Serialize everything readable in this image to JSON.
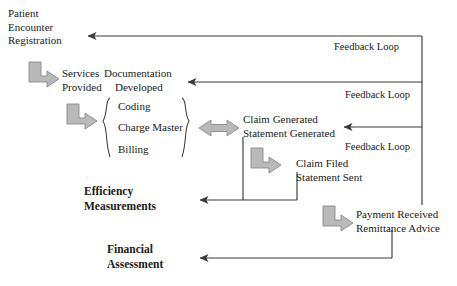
{
  "diagram": {
    "type": "flowchart",
    "colors": {
      "line": "#3a3a3a",
      "block_arrow_fill": "#b9b9b9",
      "block_arrow_stroke": "#8a8a8a",
      "text": "#1a1a1a",
      "background": "#ffffff"
    },
    "nodes": {
      "patient_encounter": "Patient\nEncounter\nRegistration",
      "services_provided": "Services\nProvided",
      "documentation_developed": "Documentation\n    Developed",
      "coding": "Coding",
      "charge_master": "Charge Master",
      "billing": "Billing",
      "claim_generated": "Claim Generated\nStatement Generated",
      "claim_filed": "Claim Filed\nStatement Sent",
      "payment_received": "Payment Received\nRemittance Advice",
      "efficiency_measurements": "Efficiency\nMeasurements",
      "financial_assessment": "Financial\nAssessment"
    },
    "feedback_labels": {
      "loop_1": "Feedback Loop",
      "loop_2": "Feedback Loop",
      "loop_3": "Feedback Loop"
    }
  }
}
